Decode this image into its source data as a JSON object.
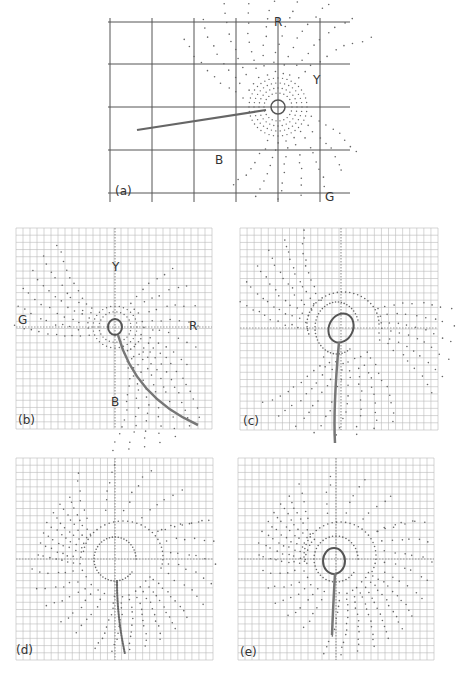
{
  "figure": {
    "panels": [
      {
        "id": "a",
        "label": "(a)",
        "axis_labels": {
          "top": "R",
          "right_upper": "Y",
          "bottom_left": "B",
          "bottom_right": "G"
        }
      },
      {
        "id": "b",
        "label": "(b)",
        "axis_labels": {
          "top": "Y",
          "left": "G",
          "right": "R",
          "bottom": "B"
        }
      },
      {
        "id": "c",
        "label": "(c)"
      },
      {
        "id": "d",
        "label": "(d)"
      },
      {
        "id": "e",
        "label": "(e)"
      }
    ]
  },
  "chart_data": [
    {
      "type": "scatter",
      "title": "(a)",
      "grid": true,
      "grid_cells": [
        5,
        4
      ],
      "axis_labels": [
        "R",
        "Y",
        "B",
        "G"
      ],
      "description": "Dot field radiating from center with concentric dotted rings around a small circle; a straight trajectory line extends from the center to the left-lower area",
      "center": [
        278,
        107
      ],
      "trajectory": [
        [
          137,
          130
        ],
        [
          266,
          110
        ]
      ],
      "color": "#666666"
    },
    {
      "type": "scatter",
      "title": "(b)",
      "grid": true,
      "grid_cells": [
        28,
        28
      ],
      "axis_labels": {
        "top": "Y",
        "left": "G",
        "right": "R",
        "bottom": "B"
      },
      "description": "Dot fans spreading toward G (left) and toward lower-right between R and B; small loop at origin with curved trajectory descending toward lower right",
      "trajectory_end": [
        198,
        425
      ]
    },
    {
      "type": "scatter",
      "title": "(c)",
      "grid": true,
      "grid_cells": [
        28,
        28
      ],
      "description": "Dot fans radiating outward from origin loop; curved trajectory heads straight down from the loop"
    },
    {
      "type": "scatter",
      "title": "(d)",
      "grid": true,
      "grid_cells": [
        28,
        28
      ],
      "description": "Larger dotted ring around origin, dot fans spreading left and right-lower; dense trajectory of dots descends vertically below origin"
    },
    {
      "type": "scatter",
      "title": "(e)",
      "grid": true,
      "grid_cells": [
        28,
        28
      ],
      "description": "Small solid loop at origin surrounded by dotted spiral; dot fans spread to the left and lower-right; trajectory descends vertically"
    }
  ]
}
